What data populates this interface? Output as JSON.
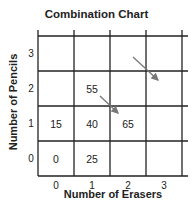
{
  "title": "Combination Chart",
  "x_axis": {
    "label": "Number of Erasers",
    "ticks": [
      "0",
      "1",
      "2",
      "3"
    ]
  },
  "y_axis": {
    "label": "Number of Pencils",
    "ticks": [
      "0",
      "1",
      "2",
      "3"
    ]
  },
  "cells": [
    {
      "erasers": 0,
      "pencils": 0,
      "value": "0"
    },
    {
      "erasers": 1,
      "pencils": 0,
      "value": "25"
    },
    {
      "erasers": 0,
      "pencils": 1,
      "value": "15"
    },
    {
      "erasers": 1,
      "pencils": 1,
      "value": "40"
    },
    {
      "erasers": 2,
      "pencils": 1,
      "value": "65"
    },
    {
      "erasers": 1,
      "pencils": 2,
      "value": "55"
    }
  ],
  "arrows": [
    {
      "from_cell": "erasers 1, pencils 2",
      "to_cell": "erasers 2, pencils 1",
      "direction": "down-right"
    },
    {
      "from_cell": "erasers 2, pencils 3",
      "to_cell": "erasers 3, pencils 2",
      "direction": "down-right"
    }
  ],
  "colors": {
    "grid": "#222222",
    "arrow": "#777777",
    "text": "#222222"
  }
}
